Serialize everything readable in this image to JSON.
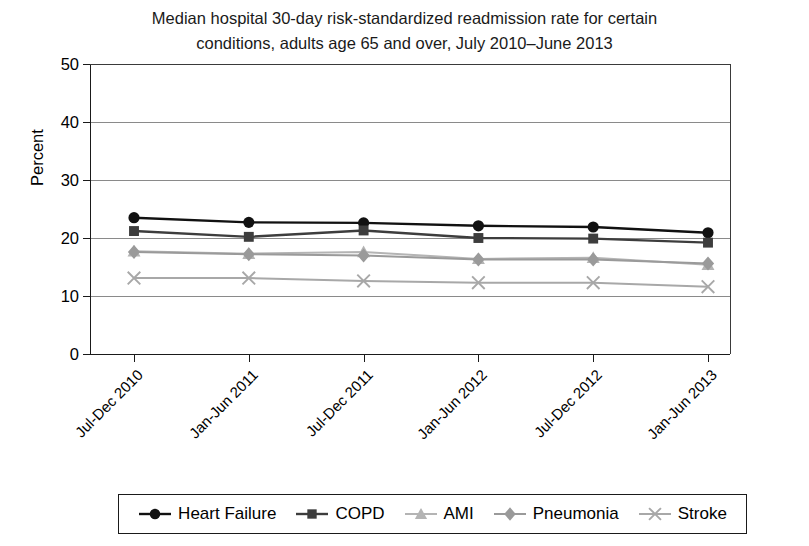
{
  "chart_data": {
    "type": "line",
    "title": "Median hospital 30-day risk-standardized readmission rate for certain conditions, adults age 65 and over, July 2010–June 2013",
    "title_line1": "Median hospital 30-day risk-standardized readmission rate for certain",
    "title_line2": "conditions, adults age 65 and over, July 2010–June 2013",
    "xlabel": "",
    "ylabel": "Percent",
    "ylim": [
      0,
      50
    ],
    "yticks": [
      0,
      10,
      20,
      30,
      40,
      50
    ],
    "ytick_labels": [
      "0",
      "10",
      "20",
      "30",
      "40",
      "50"
    ],
    "grid": true,
    "legend_position": "bottom",
    "categories": [
      "Jul-Dec 2010",
      "Jan-Jun 2011",
      "Jul-Dec 2011",
      "Jan-Jun 2012",
      "Jul-Dec 2012",
      "Jan-Jun 2013"
    ],
    "series": [
      {
        "name": "Heart Failure",
        "marker": "circle",
        "color": "#111111",
        "values": [
          23.5,
          22.7,
          22.6,
          22.1,
          21.9,
          20.9
        ]
      },
      {
        "name": "COPD",
        "marker": "square",
        "color": "#3d3d3d",
        "values": [
          21.2,
          20.2,
          21.3,
          20.0,
          19.9,
          19.2
        ]
      },
      {
        "name": "AMI",
        "marker": "triangle",
        "color": "#b4b4b4",
        "values": [
          17.7,
          17.3,
          17.6,
          16.4,
          16.6,
          15.4
        ]
      },
      {
        "name": "Pneumonia",
        "marker": "diamond",
        "color": "#9a9a9a",
        "values": [
          17.6,
          17.2,
          17.0,
          16.3,
          16.3,
          15.6
        ]
      },
      {
        "name": "Stroke",
        "marker": "x",
        "color": "#a8a8a8",
        "values": [
          13.1,
          13.1,
          12.6,
          12.3,
          12.3,
          11.6
        ]
      }
    ]
  },
  "legend": {
    "items": [
      {
        "label": "Heart Failure"
      },
      {
        "label": "COPD"
      },
      {
        "label": "AMI"
      },
      {
        "label": "Pneumonia"
      },
      {
        "label": "Stroke"
      }
    ]
  }
}
